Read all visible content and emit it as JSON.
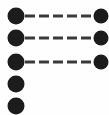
{
  "figure": {
    "title": "",
    "width": 109,
    "height": 115,
    "background_color": "#fefefe",
    "node_color": "#1c1c1c",
    "link_color": "#3a3a3a"
  },
  "chart_data": {
    "type": "scatter",
    "title": "",
    "xlabel": "",
    "ylabel": "",
    "grid": false,
    "legend_position": "none",
    "xlim": [
      0,
      109
    ],
    "ylim": [
      0,
      115
    ],
    "columns": [
      {
        "name": "left-column",
        "marker": "filled-circle",
        "marker_diameter": 17,
        "x": 16,
        "count": 5,
        "y_values": [
          16,
          38,
          62,
          84,
          106
        ]
      },
      {
        "name": "right-column",
        "marker": "filled-circle",
        "marker_diameter": 15,
        "x": 101,
        "count": 3,
        "y_values": [
          16,
          38,
          62
        ]
      }
    ],
    "nodes": [
      {
        "id": "L1",
        "column": "left",
        "x": 16,
        "y": 16,
        "r": 8.5
      },
      {
        "id": "L2",
        "column": "left",
        "x": 16,
        "y": 38,
        "r": 8.5
      },
      {
        "id": "L3",
        "column": "left",
        "x": 16,
        "y": 62,
        "r": 8.5
      },
      {
        "id": "L4",
        "column": "left",
        "x": 16,
        "y": 84,
        "r": 8.5
      },
      {
        "id": "L5",
        "column": "left",
        "x": 16,
        "y": 106,
        "r": 8.5
      },
      {
        "id": "R1",
        "column": "right",
        "x": 101,
        "y": 16,
        "r": 7.5
      },
      {
        "id": "R2",
        "column": "right",
        "x": 101,
        "y": 38,
        "r": 7.5
      },
      {
        "id": "R3",
        "column": "right",
        "x": 101,
        "y": 62,
        "r": 7.5
      }
    ],
    "links": [
      {
        "id": "E1",
        "from": "L1",
        "to": "R1",
        "style": "dashed",
        "y": 16,
        "x_start": 25,
        "x_end": 93,
        "dash_length": 10,
        "dash_gap": 4,
        "width": 3
      },
      {
        "id": "E2",
        "from": "L2",
        "to": "R2",
        "style": "dashed",
        "y": 38,
        "x_start": 25,
        "x_end": 93,
        "dash_length": 10,
        "dash_gap": 4,
        "width": 3
      },
      {
        "id": "E3",
        "from": "L3",
        "to": "R3",
        "style": "dashed",
        "y": 62,
        "x_start": 25,
        "x_end": 93,
        "dash_length": 10,
        "dash_gap": 4,
        "width": 3
      }
    ],
    "unlinked_nodes": [
      "L4",
      "L5"
    ]
  }
}
